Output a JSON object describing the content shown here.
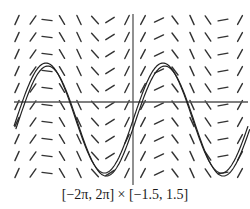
{
  "caption": "[−2π, 2π] × [−1.5, 1.5]",
  "chart_data": {
    "type": "slope_field",
    "title": "",
    "window": {
      "x": [
        "-2π",
        "2π"
      ],
      "y": [
        -1.5,
        1.5
      ]
    },
    "xlim": [
      -6.2832,
      6.2832
    ],
    "ylim": [
      -1.5,
      1.5
    ],
    "axes": {
      "x_axis_y_pixel": 102,
      "y_axis_x_pixel": 133
    },
    "slope_field": {
      "columns": 15,
      "rows": 10,
      "description": "Slope segments whose slope depends only on x (y' = f(x)); segments in each column share the same slope"
    },
    "solution_curves": [
      {
        "label": "sine-like solution",
        "shape": "sinusoid",
        "peaks_x_px": [
          46,
          163
        ],
        "peak_y_px": 63,
        "troughs_x_px": [
          102,
          220
        ],
        "trough_y_px": 173
      },
      {
        "label": "shifted solution",
        "shape": "sinusoid",
        "offset_px": 3
      }
    ],
    "colors": {
      "segments": "#333333",
      "axes": "#555555",
      "curves": "#222222"
    }
  }
}
